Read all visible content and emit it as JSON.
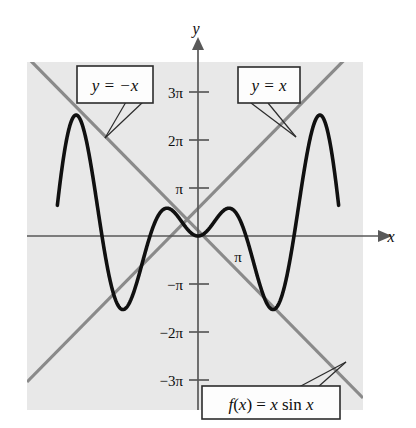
{
  "figure": {
    "background_color": "#ffffff",
    "plot_area_color": "#e8e8e8",
    "curve_color": "#101010",
    "envelope_color": "#8a8a8a",
    "axis_color": "#595959",
    "callout_fill": "#fdfdfd",
    "callout_border": "#2b2b2b"
  },
  "axes": {
    "x_axis_label": "x",
    "y_axis_label": "y",
    "x_tick_labels": [
      "π"
    ],
    "y_tick_labels": [
      "3π",
      "2π",
      "π",
      "−π",
      "−2π",
      "−3π"
    ],
    "x_range_pi": [
      -2.93,
      2.93
    ],
    "y_range_pi": [
      -3.62,
      3.35
    ],
    "grid": false
  },
  "callouts": [
    {
      "id": "line-neg-x",
      "text": "y = −x",
      "target": "descending envelope line"
    },
    {
      "id": "line-pos-x",
      "text": "y = x",
      "target": "ascending envelope line"
    },
    {
      "id": "function",
      "text": "f(x) = x sin x",
      "target": "bold black curve"
    }
  ],
  "chart_data": {
    "type": "line",
    "title": "f(x) = x sin x",
    "xlabel": "x",
    "ylabel": "y",
    "xlim_pi": [
      -2.93,
      2.93
    ],
    "ylim_pi": [
      -3.62,
      3.35
    ],
    "x_tick_values_pi": [
      1
    ],
    "x_tick_labels": [
      "π"
    ],
    "y_tick_values_pi": [
      3,
      2,
      1,
      -1,
      -2,
      -3
    ],
    "y_tick_labels": [
      "3π",
      "2π",
      "π",
      "−π",
      "−2π",
      "−3π"
    ],
    "grid": false,
    "legend_position": "callout-boxes",
    "series": [
      {
        "name": "f(x) = x sin x",
        "style": "bold-black",
        "expression": "x*sin(x)",
        "domain_pi": [
          -2.93,
          2.93
        ],
        "key_points": [
          {
            "label": "left end",
            "x_pi": -2.93,
            "y_pi": -3.62
          },
          {
            "label": "left zero",
            "x_pi": -3,
            "y_pi": 0
          },
          {
            "label": "left major maximum",
            "x_pi": -2.46,
            "y_pi": 2.46
          },
          {
            "label": "left zero at -2pi",
            "x_pi": -2,
            "y_pi": 0
          },
          {
            "label": "left minimum",
            "x_pi": -1.43,
            "y_pi": -1.43
          },
          {
            "label": "left zero at -pi",
            "x_pi": -1,
            "y_pi": 0
          },
          {
            "label": "left local maximum",
            "x_pi": -0.45,
            "y_pi": 0.44
          },
          {
            "label": "origin",
            "x_pi": 0,
            "y_pi": 0
          },
          {
            "label": "right local maximum",
            "x_pi": 0.45,
            "y_pi": 0.44
          },
          {
            "label": "zero at pi",
            "x_pi": 1,
            "y_pi": 0
          },
          {
            "label": "right minimum",
            "x_pi": 1.43,
            "y_pi": -1.43
          },
          {
            "label": "zero at 2pi",
            "x_pi": 2,
            "y_pi": 0
          },
          {
            "label": "right major maximum",
            "x_pi": 2.46,
            "y_pi": 2.46
          },
          {
            "label": "right end",
            "x_pi": 2.93,
            "y_pi": -3.62
          }
        ]
      },
      {
        "name": "y = x",
        "style": "gray-straight",
        "expression": "x",
        "points_pi": [
          [
            -2.93,
            -2.93
          ],
          [
            2.93,
            2.93
          ]
        ]
      },
      {
        "name": "y = -x",
        "style": "gray-straight",
        "expression": "-x",
        "points_pi": [
          [
            -2.93,
            2.93
          ],
          [
            2.93,
            -2.93
          ]
        ]
      }
    ]
  }
}
